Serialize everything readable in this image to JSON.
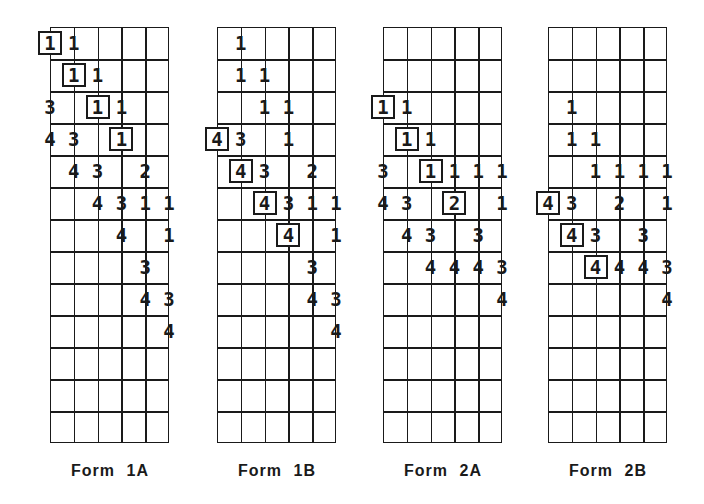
{
  "figure": {
    "columns": 5,
    "rows": 13,
    "forms": [
      {
        "label": "Form 1A",
        "left": 50,
        "entries": [
          {
            "row": 1,
            "col": 0,
            "value": "1",
            "boxed": true
          },
          {
            "row": 1,
            "col": 1,
            "value": "1",
            "boxed": false
          },
          {
            "row": 2,
            "col": 1,
            "value": "1",
            "boxed": true
          },
          {
            "row": 2,
            "col": 2,
            "value": "1",
            "boxed": false
          },
          {
            "row": 3,
            "col": 0,
            "value": "3",
            "boxed": false
          },
          {
            "row": 3,
            "col": 2,
            "value": "1",
            "boxed": true
          },
          {
            "row": 3,
            "col": 3,
            "value": "1",
            "boxed": false
          },
          {
            "row": 4,
            "col": 0,
            "value": "4",
            "boxed": false
          },
          {
            "row": 4,
            "col": 1,
            "value": "3",
            "boxed": false
          },
          {
            "row": 4,
            "col": 3,
            "value": "1",
            "boxed": true
          },
          {
            "row": 5,
            "col": 1,
            "value": "4",
            "boxed": false
          },
          {
            "row": 5,
            "col": 2,
            "value": "3",
            "boxed": false
          },
          {
            "row": 5,
            "col": 4,
            "value": "2",
            "boxed": false
          },
          {
            "row": 6,
            "col": 2,
            "value": "4",
            "boxed": false
          },
          {
            "row": 6,
            "col": 3,
            "value": "3",
            "boxed": false
          },
          {
            "row": 6,
            "col": 4,
            "value": "1",
            "boxed": false
          },
          {
            "row": 6,
            "col": 5,
            "value": "1",
            "boxed": false
          },
          {
            "row": 7,
            "col": 3,
            "value": "4",
            "boxed": false
          },
          {
            "row": 7,
            "col": 5,
            "value": "1",
            "boxed": false
          },
          {
            "row": 8,
            "col": 4,
            "value": "3",
            "boxed": false
          },
          {
            "row": 9,
            "col": 4,
            "value": "4",
            "boxed": false
          },
          {
            "row": 9,
            "col": 5,
            "value": "3",
            "boxed": false
          },
          {
            "row": 10,
            "col": 5,
            "value": "4",
            "boxed": false
          }
        ]
      },
      {
        "label": "Form 1B",
        "left": 217,
        "entries": [
          {
            "row": 1,
            "col": 1,
            "value": "1",
            "boxed": false
          },
          {
            "row": 2,
            "col": 1,
            "value": "1",
            "boxed": false
          },
          {
            "row": 2,
            "col": 2,
            "value": "1",
            "boxed": false
          },
          {
            "row": 3,
            "col": 2,
            "value": "1",
            "boxed": false
          },
          {
            "row": 3,
            "col": 3,
            "value": "1",
            "boxed": false
          },
          {
            "row": 4,
            "col": 0,
            "value": "4",
            "boxed": true
          },
          {
            "row": 4,
            "col": 1,
            "value": "3",
            "boxed": false
          },
          {
            "row": 4,
            "col": 3,
            "value": "1",
            "boxed": false
          },
          {
            "row": 5,
            "col": 1,
            "value": "4",
            "boxed": true
          },
          {
            "row": 5,
            "col": 2,
            "value": "3",
            "boxed": false
          },
          {
            "row": 5,
            "col": 4,
            "value": "2",
            "boxed": false
          },
          {
            "row": 6,
            "col": 2,
            "value": "4",
            "boxed": true
          },
          {
            "row": 6,
            "col": 3,
            "value": "3",
            "boxed": false
          },
          {
            "row": 6,
            "col": 4,
            "value": "1",
            "boxed": false
          },
          {
            "row": 6,
            "col": 5,
            "value": "1",
            "boxed": false
          },
          {
            "row": 7,
            "col": 3,
            "value": "4",
            "boxed": true
          },
          {
            "row": 7,
            "col": 5,
            "value": "1",
            "boxed": false
          },
          {
            "row": 8,
            "col": 4,
            "value": "3",
            "boxed": false
          },
          {
            "row": 9,
            "col": 4,
            "value": "4",
            "boxed": false
          },
          {
            "row": 9,
            "col": 5,
            "value": "3",
            "boxed": false
          },
          {
            "row": 10,
            "col": 5,
            "value": "4",
            "boxed": false
          }
        ]
      },
      {
        "label": "Form 2A",
        "left": 383,
        "entries": [
          {
            "row": 3,
            "col": 0,
            "value": "1",
            "boxed": true
          },
          {
            "row": 3,
            "col": 1,
            "value": "1",
            "boxed": false
          },
          {
            "row": 4,
            "col": 1,
            "value": "1",
            "boxed": true
          },
          {
            "row": 4,
            "col": 2,
            "value": "1",
            "boxed": false
          },
          {
            "row": 5,
            "col": 0,
            "value": "3",
            "boxed": false
          },
          {
            "row": 5,
            "col": 2,
            "value": "1",
            "boxed": true
          },
          {
            "row": 5,
            "col": 3,
            "value": "1",
            "boxed": false
          },
          {
            "row": 5,
            "col": 4,
            "value": "1",
            "boxed": false
          },
          {
            "row": 5,
            "col": 5,
            "value": "1",
            "boxed": false
          },
          {
            "row": 6,
            "col": 0,
            "value": "4",
            "boxed": false
          },
          {
            "row": 6,
            "col": 1,
            "value": "3",
            "boxed": false
          },
          {
            "row": 6,
            "col": 3,
            "value": "2",
            "boxed": true
          },
          {
            "row": 6,
            "col": 5,
            "value": "1",
            "boxed": false
          },
          {
            "row": 7,
            "col": 1,
            "value": "4",
            "boxed": false
          },
          {
            "row": 7,
            "col": 2,
            "value": "3",
            "boxed": false
          },
          {
            "row": 7,
            "col": 4,
            "value": "3",
            "boxed": false
          },
          {
            "row": 8,
            "col": 2,
            "value": "4",
            "boxed": false
          },
          {
            "row": 8,
            "col": 3,
            "value": "4",
            "boxed": false
          },
          {
            "row": 8,
            "col": 4,
            "value": "4",
            "boxed": false
          },
          {
            "row": 8,
            "col": 5,
            "value": "3",
            "boxed": false
          },
          {
            "row": 9,
            "col": 5,
            "value": "4",
            "boxed": false
          }
        ]
      },
      {
        "label": "Form 2B",
        "left": 548,
        "entries": [
          {
            "row": 3,
            "col": 1,
            "value": "1",
            "boxed": false
          },
          {
            "row": 4,
            "col": 1,
            "value": "1",
            "boxed": false
          },
          {
            "row": 4,
            "col": 2,
            "value": "1",
            "boxed": false
          },
          {
            "row": 5,
            "col": 2,
            "value": "1",
            "boxed": false
          },
          {
            "row": 5,
            "col": 3,
            "value": "1",
            "boxed": false
          },
          {
            "row": 5,
            "col": 4,
            "value": "1",
            "boxed": false
          },
          {
            "row": 5,
            "col": 5,
            "value": "1",
            "boxed": false
          },
          {
            "row": 6,
            "col": 0,
            "value": "4",
            "boxed": true
          },
          {
            "row": 6,
            "col": 1,
            "value": "3",
            "boxed": false
          },
          {
            "row": 6,
            "col": 3,
            "value": "2",
            "boxed": false
          },
          {
            "row": 6,
            "col": 5,
            "value": "1",
            "boxed": false
          },
          {
            "row": 7,
            "col": 1,
            "value": "4",
            "boxed": true
          },
          {
            "row": 7,
            "col": 2,
            "value": "3",
            "boxed": false
          },
          {
            "row": 7,
            "col": 4,
            "value": "3",
            "boxed": false
          },
          {
            "row": 8,
            "col": 2,
            "value": "4",
            "boxed": true
          },
          {
            "row": 8,
            "col": 3,
            "value": "4",
            "boxed": false
          },
          {
            "row": 8,
            "col": 4,
            "value": "4",
            "boxed": false
          },
          {
            "row": 8,
            "col": 5,
            "value": "3",
            "boxed": false
          },
          {
            "row": 9,
            "col": 5,
            "value": "4",
            "boxed": false
          }
        ]
      }
    ]
  }
}
